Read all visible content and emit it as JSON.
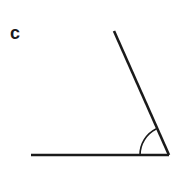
{
  "figure": {
    "type": "geometry-angle-diagram",
    "label": "c",
    "background_color": "#ffffff",
    "stroke_color": "#1a1a1a",
    "ray_stroke_width": 2.6,
    "arc_stroke_width": 1.6,
    "label_position": {
      "x": 10,
      "y": 24
    },
    "vertex": {
      "x": 169,
      "y": 155
    },
    "horizontal_ray": {
      "name": "horizontal-ray",
      "from": {
        "x": 31,
        "y": 155
      },
      "to": {
        "x": 169,
        "y": 155
      }
    },
    "diagonal_ray": {
      "name": "diagonal-ray",
      "from": {
        "x": 169,
        "y": 155
      },
      "to": {
        "x": 114,
        "y": 31
      }
    },
    "angle_arc": {
      "name": "angle-arc",
      "radius": 29,
      "start": {
        "x": 140,
        "y": 155
      },
      "end": {
        "x": 156,
        "y": 129
      },
      "sweep_degrees": 66
    }
  }
}
